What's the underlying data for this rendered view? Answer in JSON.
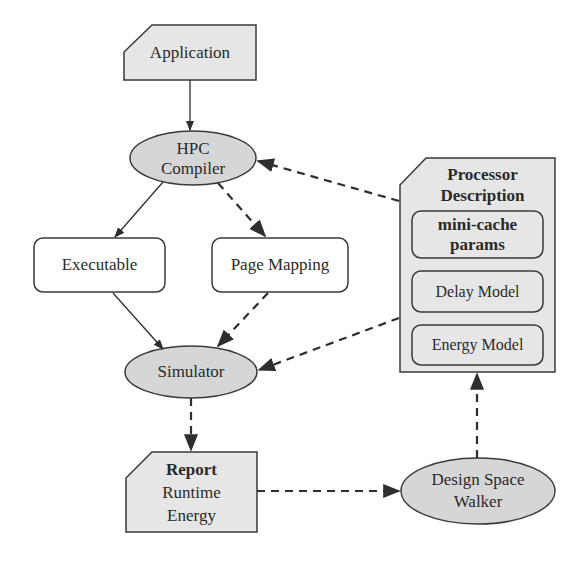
{
  "colors": {
    "node_fill": "#e6e6e6",
    "ellipse_fill": "#d6d6d6",
    "box_fill": "#ffffff",
    "stroke": "#3a3a3a",
    "text": "#2a2a2a"
  },
  "nodes": {
    "application": {
      "label": "Application",
      "shape": "card"
    },
    "hpc_compiler": {
      "line1": "HPC",
      "line2": "Compiler",
      "shape": "ellipse"
    },
    "executable": {
      "label": "Executable",
      "shape": "rounded-rect"
    },
    "page_mapping": {
      "label": "Page Mapping",
      "shape": "rounded-rect"
    },
    "simulator": {
      "label": "Simulator",
      "shape": "ellipse"
    },
    "processor_description": {
      "line1": "Processor",
      "line2": "Description",
      "shape": "card",
      "children": {
        "mini_cache": {
          "line1": "mini-cache",
          "line2": "params"
        },
        "delay_model": {
          "label": "Delay Model"
        },
        "energy_model": {
          "label": "Energy Model"
        }
      }
    },
    "report": {
      "title": "Report",
      "line2": "Runtime",
      "line3": "Energy",
      "shape": "card"
    },
    "design_space_walker": {
      "line1": "Design Space",
      "line2": "Walker",
      "shape": "ellipse"
    }
  },
  "edges": [
    {
      "from": "Application",
      "to": "HPC Compiler",
      "style": "solid"
    },
    {
      "from": "HPC Compiler",
      "to": "Executable",
      "style": "solid"
    },
    {
      "from": "HPC Compiler",
      "to": "Page Mapping",
      "style": "dashed"
    },
    {
      "from": "Executable",
      "to": "Simulator",
      "style": "solid"
    },
    {
      "from": "Page Mapping",
      "to": "Simulator",
      "style": "dashed"
    },
    {
      "from": "Processor Description",
      "to": "HPC Compiler",
      "style": "dashed"
    },
    {
      "from": "Processor Description",
      "to": "Simulator",
      "style": "dashed"
    },
    {
      "from": "Simulator",
      "to": "Report",
      "style": "dashed"
    },
    {
      "from": "Report",
      "to": "Design Space Walker",
      "style": "dashed"
    },
    {
      "from": "Design Space Walker",
      "to": "Processor Description",
      "style": "dashed"
    }
  ]
}
